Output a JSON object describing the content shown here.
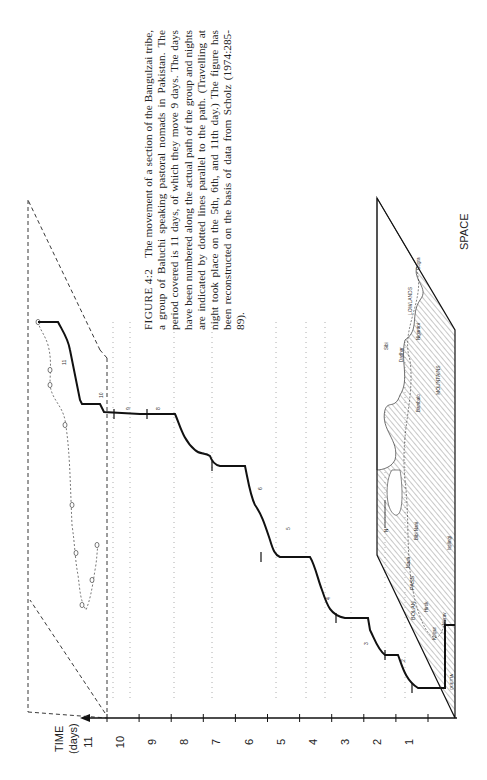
{
  "figure": {
    "label": "FIGURE 4:2",
    "caption": "The movement of a section of the Bangulzai tribe, a group of Baluchi speaking pastoral nomads in Pakistan. The period covered is 11 days, of which they move 9 days. The days have been numbered along the actual path of the group and nights are indicated by dotted lines parallel to the path. (Travelling at night took place on the 5th, 6th, and 11th day.) The figure has been reconstructed on the basis of data from Scholz (1974:285-89)."
  },
  "chart_data": {
    "type": "line",
    "ylabel": "TIME (days)",
    "xlabel": "SPACE",
    "time_axis": {
      "label_line1": "TIME",
      "label_line2": "(days)",
      "ticks": [
        "1",
        "2",
        "3",
        "4",
        "5",
        "6",
        "7",
        "8",
        "9",
        "10",
        "11"
      ],
      "range": [
        0,
        11
      ]
    },
    "space_axis_label": "SPACE",
    "day_labels": [
      "2",
      "3",
      "4",
      "5",
      "6",
      "7",
      "8",
      "9",
      "10",
      "11"
    ],
    "moving_days": 9,
    "total_days": 11,
    "night_travel_days": [
      5,
      6,
      11
    ],
    "map": {
      "regions": [
        "MOUNTAINS",
        "LOWLANDS"
      ],
      "places": [
        "QUETTA",
        "Kolpur",
        "Mərav",
        "Hirok",
        "BOLAN",
        "PASS",
        "Mach",
        "Isplingi",
        "Bibi Nani",
        "Dadhar",
        "Bambalo",
        "Sibi",
        "Nigarani",
        "Gogra"
      ],
      "north_arrow": "N"
    }
  }
}
